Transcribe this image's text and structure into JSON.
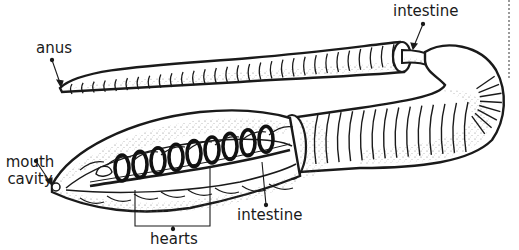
{
  "diagram": {
    "labels": {
      "anus": "anus",
      "intestine_top": "intestine",
      "mouth_cavity_line1": "mouth",
      "mouth_cavity_line2": "cavity",
      "hearts": "hearts",
      "intestine_bottom": "intestine"
    },
    "colors": {
      "ink": "#1a1a1a",
      "body_fill": "#ffffff",
      "stipple": "#6b6b6b",
      "heart_ring": "#111111"
    }
  }
}
